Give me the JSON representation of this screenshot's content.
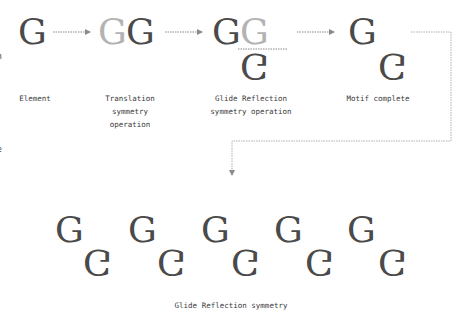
{
  "diagram": {
    "title": "Glide Reflection symmetry",
    "element_glyph": "G",
    "colors": {
      "glyph": "#4a4a4a",
      "glyph_faded": "#b3b3b3",
      "connector": "#8a8a8a",
      "text": "#3a3a3a"
    },
    "steps": [
      {
        "label": "Element"
      },
      {
        "label": "Translation\nsymmetry\noperation"
      },
      {
        "label": "Glide Reflection\nsymmetry operation"
      },
      {
        "label": "Motif complete"
      }
    ],
    "result_caption": "Glide Reflection symmetry",
    "left_edge_fragments": [
      "n",
      "e"
    ],
    "pattern_repeats": 5
  }
}
